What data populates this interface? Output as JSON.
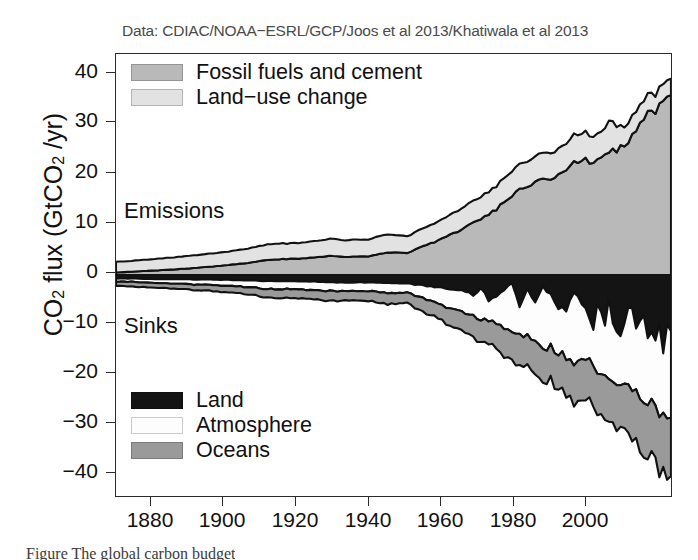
{
  "figure": {
    "source_note": "Data: CDIAC/NOAA−ESRL/GCP/Joos et al 2013/Khatiwala et al 2013",
    "caption_partial": "Figure        The global carbon budget",
    "annotations": {
      "emissions": "Emissions",
      "sinks": "Sinks"
    }
  },
  "colors": {
    "fossil_fuels": "#b9b9b9",
    "land_use_change": "#e2e2e2",
    "land_sink": "#141414",
    "atmosphere_sink": "#fdfdfd",
    "ocean_sink": "#9a9a9a",
    "outline": "#111111",
    "axis": "#2b2b2b",
    "source_text": "#4a4a4a"
  },
  "legend_top": {
    "items": [
      {
        "label": "Fossil fuels and cement",
        "color": "#b9b9b9",
        "swatch": "fossil-fuels-swatch"
      },
      {
        "label": "Land−use change",
        "color": "#e2e2e2",
        "swatch": "land-use-change-swatch"
      }
    ]
  },
  "legend_bottom": {
    "items": [
      {
        "label": "Land",
        "color": "#141414",
        "swatch": "land-sink-swatch"
      },
      {
        "label": "Atmosphere",
        "color": "#fdfdfd",
        "swatch": "atmosphere-sink-swatch"
      },
      {
        "label": "Oceans",
        "color": "#9a9a9a",
        "swatch": "ocean-sink-swatch"
      }
    ]
  },
  "chart_data": {
    "type": "area",
    "title": "",
    "subtitle": "Data: CDIAC/NOAA−ESRL/GCP/Joos et al 2013/Khatiwala et al 2013",
    "xlabel": "",
    "ylabel": "CO2 flux (GtCO2 /yr)",
    "xlim": [
      1870,
      2013
    ],
    "ylim": [
      -44,
      44
    ],
    "xticks": [
      1880,
      1900,
      1920,
      1940,
      1960,
      1980,
      2000
    ],
    "yticks": [
      -40,
      -30,
      -20,
      -10,
      0,
      10,
      20,
      30,
      40
    ],
    "grid": false,
    "legend_position": "inside-top-left and inside-bottom-left",
    "stacked": true,
    "zero_line": 0,
    "x": [
      1870,
      1875,
      1880,
      1885,
      1890,
      1895,
      1900,
      1905,
      1910,
      1915,
      1920,
      1925,
      1930,
      1935,
      1940,
      1945,
      1950,
      1955,
      1960,
      1962,
      1964,
      1966,
      1968,
      1970,
      1972,
      1974,
      1976,
      1978,
      1980,
      1982,
      1984,
      1986,
      1988,
      1990,
      1991,
      1992,
      1993,
      1994,
      1995,
      1996,
      1997,
      1998,
      1999,
      2000,
      2001,
      2002,
      2003,
      2004,
      2005,
      2006,
      2007,
      2008,
      2009,
      2010,
      2011,
      2012,
      2013
    ],
    "series": [
      {
        "name": "Fossil fuels and cement",
        "stack": "emissions",
        "color": "#b9b9b9",
        "units": "GtCO2/yr",
        "values": [
          0.5,
          0.7,
          0.9,
          1.1,
          1.4,
          1.7,
          2.1,
          2.5,
          3.1,
          3.2,
          3.4,
          3.8,
          3.6,
          3.7,
          4.5,
          4.4,
          6.0,
          7.5,
          9.5,
          10.3,
          11.2,
          12.1,
          13.1,
          14.8,
          15.9,
          17.0,
          17.7,
          18.6,
          19.5,
          19.2,
          20.2,
          21.0,
          22.3,
          22.7,
          22.9,
          22.6,
          22.5,
          23.0,
          23.6,
          24.3,
          24.7,
          24.7,
          24.8,
          25.4,
          25.7,
          26.2,
          27.7,
          29.0,
          30.1,
          31.2,
          32.2,
          32.8,
          32.3,
          33.9,
          34.8,
          35.3,
          35.8
        ]
      },
      {
        "name": "Land−use change",
        "stack": "emissions",
        "color": "#e2e2e2",
        "units": "GtCO2/yr",
        "values": [
          2.1,
          2.2,
          2.3,
          2.4,
          2.5,
          2.6,
          2.7,
          2.9,
          3.1,
          3.1,
          3.2,
          3.4,
          3.3,
          3.4,
          3.6,
          3.3,
          3.6,
          3.9,
          4.2,
          4.3,
          4.4,
          4.5,
          4.6,
          4.8,
          4.9,
          5.0,
          5.0,
          5.1,
          5.2,
          5.2,
          5.2,
          5.3,
          5.4,
          5.4,
          5.3,
          5.3,
          5.2,
          5.2,
          5.2,
          5.1,
          6.4,
          5.4,
          5.0,
          4.0,
          3.8,
          3.9,
          3.8,
          3.8,
          3.7,
          3.7,
          3.6,
          3.5,
          3.4,
          3.3,
          3.3,
          3.3,
          3.3
        ]
      },
      {
        "name": "Land",
        "stack": "sinks",
        "color": "#141414",
        "units": "GtCO2/yr",
        "values": [
          -0.7,
          -0.7,
          -0.8,
          -0.8,
          -0.9,
          -0.9,
          -1.0,
          -1.1,
          -1.2,
          -1.2,
          -1.3,
          -1.4,
          -1.5,
          -1.5,
          -1.6,
          -1.7,
          -2.2,
          -2.6,
          -3.2,
          -4.2,
          -2.6,
          -5.0,
          -4.4,
          -3.0,
          -1.6,
          -6.4,
          -2.9,
          -5.4,
          -2.4,
          -4.0,
          -6.4,
          -6.9,
          -3.4,
          -5.6,
          -6.5,
          -9.0,
          -10.8,
          -5.9,
          -7.7,
          -10.0,
          -4.5,
          -9.6,
          -11.6,
          -12.6,
          -10.0,
          -6.4,
          -6.9,
          -11.2,
          -9.1,
          -8.0,
          -12.6,
          -12.1,
          -12.9,
          -9.5,
          -15.5,
          -9.8,
          -11.2
        ]
      },
      {
        "name": "Atmosphere",
        "stack": "sinks",
        "color": "#fdfdfd",
        "units": "GtCO2/yr",
        "values": [
          -0.6,
          -0.7,
          -0.8,
          -0.9,
          -1.0,
          -1.1,
          -1.2,
          -1.4,
          -1.6,
          -1.6,
          -1.7,
          -1.8,
          -1.6,
          -1.7,
          -2.0,
          -1.9,
          -2.6,
          -3.6,
          -4.4,
          -4.0,
          -6.2,
          -4.2,
          -5.4,
          -7.4,
          -9.6,
          -5.6,
          -9.4,
          -7.6,
          -11.8,
          -10.6,
          -9.2,
          -9.6,
          -14.0,
          -11.6,
          -10.8,
          -8.2,
          -7.0,
          -13.0,
          -12.0,
          -9.6,
          -15.8,
          -11.4,
          -10.0,
          -9.4,
          -12.8,
          -16.4,
          -16.6,
          -12.4,
          -15.2,
          -17.2,
          -13.0,
          -13.6,
          -13.4,
          -17.8,
          -11.6,
          -18.4,
          -17.2
        ]
      },
      {
        "name": "Oceans",
        "stack": "sinks",
        "color": "#9a9a9a",
        "units": "GtCO2/yr",
        "values": [
          -0.8,
          -0.9,
          -0.9,
          -1.0,
          -1.1,
          -1.2,
          -1.3,
          -1.5,
          -1.7,
          -1.7,
          -1.8,
          -1.9,
          -1.9,
          -2.0,
          -2.2,
          -2.1,
          -2.7,
          -3.2,
          -3.9,
          -4.2,
          -4.4,
          -4.7,
          -5.0,
          -5.5,
          -5.8,
          -6.1,
          -6.3,
          -6.6,
          -6.9,
          -6.8,
          -7.1,
          -7.4,
          -7.7,
          -7.9,
          -7.9,
          -7.8,
          -7.8,
          -8.0,
          -8.2,
          -8.4,
          -8.5,
          -8.5,
          -8.6,
          -8.8,
          -8.9,
          -9.1,
          -9.5,
          -9.9,
          -10.2,
          -10.5,
          -10.7,
          -10.9,
          -10.8,
          -11.2,
          -11.4,
          -11.5,
          -11.6
        ]
      }
    ]
  },
  "axis": {
    "yticks": [
      "40",
      "30",
      "20",
      "10",
      "0",
      "−10",
      "−20",
      "−30",
      "−40"
    ],
    "xticks": [
      "1880",
      "1900",
      "1920",
      "1940",
      "1960",
      "1980",
      "2000"
    ],
    "ylabel_main": "CO",
    "ylabel_sub1": "2",
    "ylabel_mid": " flux (GtCO",
    "ylabel_sub2": "2",
    "ylabel_end": " /yr)"
  }
}
